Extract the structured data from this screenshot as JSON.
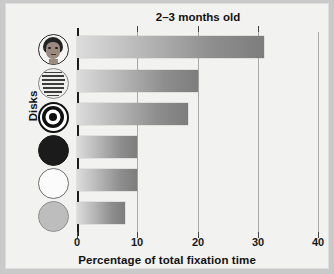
{
  "chart_data": {
    "type": "bar",
    "orientation": "horizontal",
    "title": "2–3 months old",
    "xlabel": "Percentage of total fixation time",
    "ylabel": "Disks",
    "xlim": [
      0,
      40
    ],
    "xticks": [
      "0",
      "10",
      "20",
      "30",
      "40"
    ],
    "xtick_values": [
      0,
      10,
      20,
      30,
      40
    ],
    "grid": "vertical",
    "legend": "none",
    "categories": [
      "face disk",
      "printed-matter disk",
      "bullseye disk",
      "black disk",
      "white disk",
      "gray disk"
    ],
    "values": [
      31,
      20,
      18.5,
      10,
      10,
      8
    ],
    "bars": [
      {
        "label": "face disk",
        "icon": "face-disk-icon",
        "value": 31
      },
      {
        "label": "printed-matter disk",
        "icon": "newsprint-disk-icon",
        "value": 20
      },
      {
        "label": "bullseye disk",
        "icon": "bullseye-disk-icon",
        "value": 18.5
      },
      {
        "label": "black disk",
        "icon": "black-disk-icon",
        "value": 10
      },
      {
        "label": "white disk",
        "icon": "white-disk-icon",
        "value": 10
      },
      {
        "label": "gray disk",
        "icon": "gray-disk-icon",
        "value": 8
      }
    ],
    "colors": {
      "bar_gradient_start": "#dcdcdc",
      "bar_gradient_end": "#7d7d7d",
      "axis": "#1c1c1c",
      "gridline": "#a9a9a9",
      "plot_background": "#f2f2f0",
      "figure_background": "#c9c9c9"
    }
  },
  "print_disk_line_widths": [
    "72%",
    "84%",
    "90%",
    "88%",
    "84%",
    "70%",
    "52%"
  ]
}
